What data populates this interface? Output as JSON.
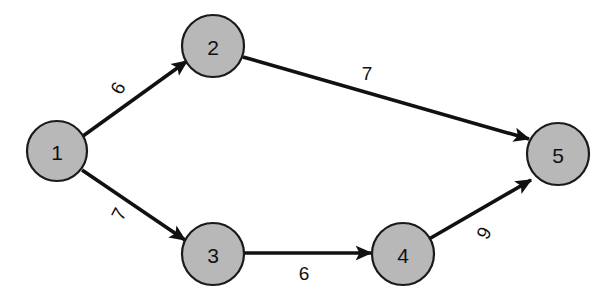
{
  "figure": {
    "type": "directed-weighted-graph",
    "background_color": "#ffffff",
    "node_fill_color": "#b8b8b8",
    "node_stroke_color": "#1a1a1a",
    "edge_color": "#111111",
    "text_color": "#111111"
  },
  "nodes": [
    {
      "id": "1",
      "label": "1",
      "cx": 57,
      "cy": 151,
      "r": 30
    },
    {
      "id": "2",
      "label": "2",
      "cx": 213,
      "cy": 46,
      "r": 31
    },
    {
      "id": "3",
      "label": "3",
      "cx": 213,
      "cy": 254,
      "r": 31
    },
    {
      "id": "4",
      "label": "4",
      "cx": 403,
      "cy": 254,
      "r": 31
    },
    {
      "id": "5",
      "label": "5",
      "cx": 558,
      "cy": 154,
      "r": 31
    }
  ],
  "edges": [
    {
      "id": "e12",
      "from": "1",
      "to": "2",
      "weight": "6",
      "x1": 83,
      "y1": 136,
      "x2": 187,
      "y2": 61,
      "label_x": 118,
      "label_y": 88,
      "label_rotation": -62
    },
    {
      "id": "e25",
      "from": "2",
      "to": "5",
      "weight": "7",
      "x1": 243,
      "y1": 57,
      "x2": 529,
      "y2": 139,
      "label_x": 367,
      "label_y": 73,
      "label_rotation": 0
    },
    {
      "id": "e13",
      "from": "1",
      "to": "3",
      "weight": "7",
      "x1": 82,
      "y1": 170,
      "x2": 185,
      "y2": 240,
      "label_x": 119,
      "label_y": 214,
      "label_rotation": -62
    },
    {
      "id": "e34",
      "from": "3",
      "to": "4",
      "weight": "6",
      "x1": 244,
      "y1": 253,
      "x2": 371,
      "y2": 253,
      "label_x": 304,
      "label_y": 273,
      "label_rotation": 0
    },
    {
      "id": "e45",
      "from": "4",
      "to": "5",
      "weight": "9",
      "x1": 429,
      "y1": 239,
      "x2": 531,
      "y2": 180,
      "label_x": 484,
      "label_y": 233,
      "label_rotation": -62
    }
  ],
  "chart_data": {
    "type": "diagram",
    "title": "",
    "node_ids": [
      "1",
      "2",
      "3",
      "4",
      "5"
    ],
    "edge_list": [
      {
        "from": "1",
        "to": "2",
        "weight": 6
      },
      {
        "from": "2",
        "to": "5",
        "weight": 7
      },
      {
        "from": "1",
        "to": "3",
        "weight": 7
      },
      {
        "from": "3",
        "to": "4",
        "weight": 6
      },
      {
        "from": "4",
        "to": "5",
        "weight": 9
      }
    ]
  }
}
